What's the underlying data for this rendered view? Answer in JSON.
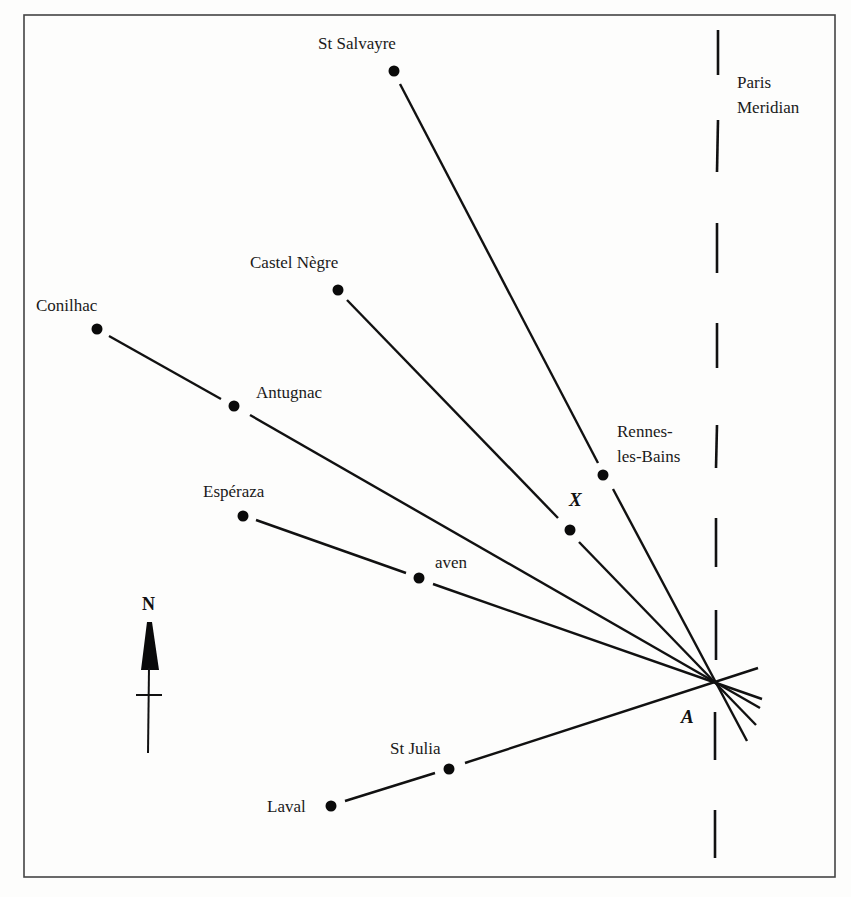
{
  "diagram": {
    "frame": {
      "x": 24,
      "y": 15,
      "width": 811,
      "height": 862
    },
    "colors": {
      "ink": "#111111",
      "background": "#fdfdfc",
      "frame": "#444444"
    },
    "meridian": {
      "label_line1": "Paris",
      "label_line2": "Meridian",
      "x": 717,
      "dashes": [
        [
          30,
          75
        ],
        [
          120,
          172
        ],
        [
          223,
          273
        ],
        [
          323,
          368
        ],
        [
          425,
          468
        ],
        [
          518,
          567
        ],
        [
          610,
          660
        ],
        [
          712,
          760
        ],
        [
          810,
          858
        ]
      ]
    },
    "focal_point": {
      "name": "A",
      "x": 714,
      "y": 681
    },
    "intermediate_point": {
      "name": "X",
      "x": 570,
      "y": 530
    },
    "places": [
      {
        "name": "St Salvayre",
        "x": 394,
        "y": 71
      },
      {
        "name": "Castel Nègre",
        "x": 338,
        "y": 290
      },
      {
        "name": "Conilhac",
        "x": 97,
        "y": 329
      },
      {
        "name": "Antugnac",
        "x": 234,
        "y": 406
      },
      {
        "name": "Rennes-les-Bains",
        "label_line1": "Rennes-",
        "label_line2": "les-Bains",
        "x": 603,
        "y": 475
      },
      {
        "name": "Espéraza",
        "x": 243,
        "y": 516
      },
      {
        "name": "aven",
        "x": 419,
        "y": 578
      },
      {
        "name": "St Julia",
        "x": 449,
        "y": 769
      },
      {
        "name": "Laval",
        "x": 331,
        "y": 806
      }
    ],
    "alignments": [
      {
        "from": "St Salvayre",
        "via": "Rennes-les-Bains",
        "to": "A"
      },
      {
        "from": "Castel Nègre",
        "via": "X",
        "to": "A"
      },
      {
        "from": "Conilhac",
        "via": "Antugnac",
        "to": "A"
      },
      {
        "from": "Espéraza",
        "via": "aven",
        "to": "A"
      },
      {
        "from": "Laval",
        "via": "St Julia",
        "to": "A"
      }
    ],
    "north_arrow": {
      "label": "N",
      "x": 149
    }
  }
}
